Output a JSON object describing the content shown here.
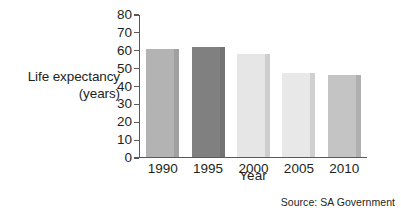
{
  "chart_data": {
    "type": "bar",
    "title": "",
    "categories": [
      "1990",
      "1995",
      "2000",
      "2005",
      "2010"
    ],
    "values": [
      61,
      62,
      58,
      47,
      46
    ],
    "series": [
      {
        "name": "Life expectancy",
        "values": [
          61,
          62,
          58,
          47,
          46
        ]
      }
    ],
    "xlabel": "Year",
    "ylabel": "Life expectancy (years)",
    "ylabel_lines": [
      "Life expectancy",
      "(years)"
    ],
    "ylim": [
      0,
      80
    ],
    "ytick_step": 10,
    "yticks": [
      "0",
      "10",
      "20",
      "30",
      "40",
      "50",
      "60",
      "70",
      "80"
    ],
    "grid": false,
    "legend": "none",
    "bar_colors": [
      "#b3b3b3",
      "#808080",
      "#e6e6e6",
      "#e8e8e8",
      "#c4c4c4"
    ],
    "axis_color": "#58595b",
    "text_color": "#231f20",
    "background": "#ffffff",
    "annotations": [
      {
        "name": "source",
        "text": "Source: SA Government"
      }
    ]
  }
}
